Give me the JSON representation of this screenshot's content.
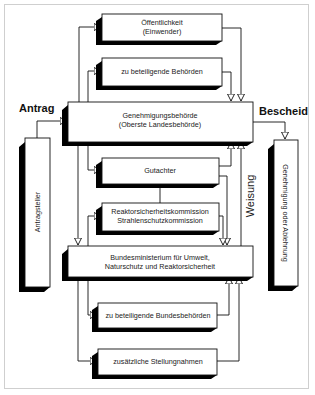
{
  "diagram": {
    "labels": {
      "antrag": "Antrag",
      "bescheid": "Bescheid",
      "weisung": "Weisung"
    },
    "boxes": {
      "oeffentlichkeit": {
        "line1": "Öffentlichkeit",
        "line2": "(Einwender)"
      },
      "behoerden": {
        "line1": "zu beteiligende Behörden"
      },
      "genehmigung": {
        "line1": "Genehmigungsbehörde",
        "line2": "(Oberste Landesbehörde)"
      },
      "antragsteller": {
        "line1": "Antragsteller"
      },
      "ergebnis": {
        "line1": "Genehmigung oder Ablehnung"
      },
      "gutachter": {
        "line1": "Gutachter"
      },
      "kommission": {
        "line1": "Reaktorsicherheitskommission",
        "line2": "Strahlenschutzkommission"
      },
      "ministerium": {
        "line1": "Bundesministerium für Umwelt,",
        "line2": "Naturschutz und Reaktorsicherheit"
      },
      "bundesbehoerden": {
        "line1": "zu beteiligende Bundesbehörden"
      },
      "stellungnahmen": {
        "line1": "zusätzliche Stellungnahmen"
      }
    },
    "colors": {
      "line": "#111111",
      "shadow": "#000000",
      "box": "#ffffff",
      "frame": "#cfcfcf"
    }
  }
}
